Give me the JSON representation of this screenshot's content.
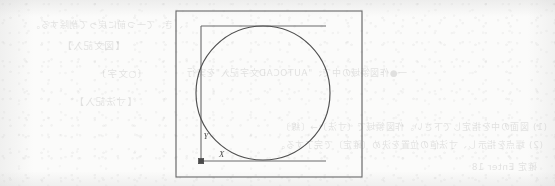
{
  "page": {
    "kind": "scanned-book-page",
    "background_color": "#fbfbfa",
    "ink_color": "#4a4a4a",
    "width": 555,
    "height": 186
  },
  "diagram": {
    "title": "",
    "stroke_color": "#5a5a5a",
    "frame": {
      "label": "drawing-border",
      "x": 176,
      "y": 11,
      "width": 186,
      "height": 166
    },
    "circle": {
      "label": "circle",
      "cx": 263,
      "cy": 93,
      "r": 67
    },
    "axes": {
      "origin_marker": "filled-square",
      "origin": {
        "x": 201,
        "y": 161
      },
      "x_axis": {
        "label": "X",
        "from_x": 201,
        "to_x": 326,
        "y": 161
      },
      "y_axis": {
        "label": "Y",
        "x": 201,
        "from_y": 161,
        "to_y": 26
      },
      "x_label_pos": {
        "x": 219,
        "y": 156
      },
      "y_label_pos": {
        "x": 204,
        "y": 138
      }
    },
    "top_line": {
      "label": "top-construction-line",
      "from_x": 201,
      "to_x": 326,
      "y": 26
    }
  },
  "bleed_through": {
    "note": "faint mirrored text showing through from the reverse side of the sheet",
    "lines": [
      {
        "text": "、き、て一つ前に戻って削除する。",
        "x": 372,
        "y": 18,
        "size": 9
      },
      {
        "text": "【図文記入】",
        "x": 430,
        "y": 38,
        "size": 9.5
      },
      {
        "text": "一●作図領域の中で、\"AUTOCAD文字記入\"を実行",
        "x": 148,
        "y": 66,
        "size": 9
      },
      {
        "text": "〔○文字〕",
        "x": 408,
        "y": 66,
        "size": 9.5
      },
      {
        "text": "【寸法記入】",
        "x": 418,
        "y": 94,
        "size": 9.5
      },
      {
        "text": "(1) 図面の中を指定して下さい。作図領域で〔寸法〕→〔線〕",
        "x": 8,
        "y": 120,
        "size": 9
      },
      {
        "text": "(2) 端点を指示し、寸法値の位置を決め〔確定〕で完了する。",
        "x": 12,
        "y": 138,
        "size": 9
      },
      {
        "text": "確定 Enter 18",
        "x": 18,
        "y": 160,
        "size": 9
      }
    ]
  }
}
